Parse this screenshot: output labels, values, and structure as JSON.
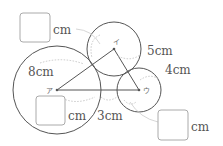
{
  "diagram": {
    "colors": {
      "stroke": "#555555",
      "leader": "#bbbbbb",
      "box": "#aaaaaa",
      "text": "#555555"
    },
    "vertices": [
      {
        "id": "A",
        "label": "ア",
        "x": 57,
        "y": 90
      },
      {
        "id": "B",
        "label": "イ",
        "x": 114,
        "y": 49
      },
      {
        "id": "C",
        "label": "ウ",
        "x": 139,
        "y": 90
      }
    ],
    "circles": [
      {
        "center": "A",
        "cx": 57,
        "cy": 90,
        "r": 44
      },
      {
        "center": "B",
        "cx": 114,
        "cy": 49,
        "r": 27
      },
      {
        "center": "C",
        "cx": 139,
        "cy": 90,
        "r": 22
      }
    ],
    "labels": [
      {
        "text": "8cm",
        "ref": "side A-B",
        "x": 28,
        "y": 76
      },
      {
        "text": "5cm",
        "ref": "radius of circle B",
        "x": 147,
        "y": 55
      },
      {
        "text": "4cm",
        "ref": "radius of circle C",
        "x": 165,
        "y": 74
      },
      {
        "text": "3cm",
        "ref": "gap on side A-C",
        "x": 97,
        "y": 120
      }
    ],
    "answer_boxes": [
      {
        "unit": "cm",
        "x": 20,
        "y": 13,
        "w": 30,
        "h": 29
      },
      {
        "unit": "cm",
        "x": 36,
        "y": 96,
        "w": 29,
        "h": 29
      },
      {
        "unit": "cm",
        "x": 158,
        "y": 110,
        "w": 30,
        "h": 30
      }
    ]
  }
}
